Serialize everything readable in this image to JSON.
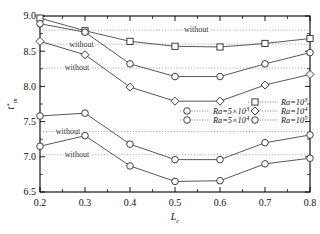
{
  "chart_data": {
    "type": "line",
    "title": "",
    "xlabel": "L_c",
    "ylabel": "t*_m",
    "xlim": [
      0.2,
      0.8
    ],
    "ylim": [
      6.5,
      9.0
    ],
    "grid": "horizontal-dotted-reference-lines",
    "legend_position": "inside-middle-right",
    "x": [
      0.2,
      0.3,
      0.4,
      0.5,
      0.6,
      0.7,
      0.8
    ],
    "xticklabels": [
      "0.2",
      "0.3",
      "0.4",
      "0.5",
      "0.6",
      "0.7",
      "0.8"
    ],
    "yticklabels": [
      "6.5",
      "7.0",
      "7.5",
      "8.0",
      "8.5",
      "9.0"
    ],
    "yticks": [
      6.5,
      7.0,
      7.5,
      8.0,
      8.5,
      9.0
    ],
    "series": [
      {
        "name": "Ra=10^3",
        "marker": "square",
        "values": [
          8.97,
          8.79,
          8.64,
          8.57,
          8.56,
          8.61,
          8.68
        ]
      },
      {
        "name": "Ra=5x10^3",
        "marker": "circle",
        "values": [
          8.89,
          8.77,
          8.32,
          8.14,
          8.14,
          8.32,
          8.48
        ]
      },
      {
        "name": "Ra=10^4",
        "marker": "diamond",
        "values": [
          8.64,
          8.45,
          7.99,
          7.79,
          7.79,
          8.02,
          8.17
        ]
      },
      {
        "name": "Ra=5x10^4",
        "marker": "circle",
        "values": [
          7.58,
          7.62,
          7.18,
          6.96,
          6.96,
          7.2,
          7.31
        ]
      },
      {
        "name": "Ra=10^5",
        "marker": "circle",
        "values": [
          7.15,
          7.3,
          6.87,
          6.65,
          6.66,
          6.9,
          6.98
        ]
      }
    ],
    "reference_lines": [
      {
        "label": "without",
        "value": 8.8,
        "label_x": 0.52
      },
      {
        "label": "without",
        "value": 8.6,
        "label_x": 0.265
      },
      {
        "label": "without",
        "value": 8.26,
        "label_x": 0.255
      },
      {
        "label": "without",
        "value": 7.36,
        "label_x": 0.235
      },
      {
        "label": "without",
        "value": 7.03,
        "label_x": 0.255
      }
    ]
  },
  "axes": {
    "y_label_base": "t",
    "y_label_star": "*",
    "y_label_sub": "m",
    "x_label_base": "L",
    "x_label_sub": "c"
  },
  "legend": {
    "entries": [
      {
        "prefix": "Ra=",
        "value": "10",
        "exp": "3",
        "marker": "square",
        "col": 2,
        "row": 1
      },
      {
        "prefix": "Ra=",
        "value": "5×10",
        "exp": "3",
        "marker": "circle",
        "col": 1,
        "row": 2
      },
      {
        "prefix": "Ra=",
        "value": "10",
        "exp": "4",
        "marker": "diamond",
        "col": 2,
        "row": 2
      },
      {
        "prefix": "Ra=",
        "value": "5×10",
        "exp": "4",
        "marker": "circle",
        "col": 1,
        "row": 3
      },
      {
        "prefix": "Ra=",
        "value": "10",
        "exp": "5",
        "marker": "circle",
        "col": 2,
        "row": 3
      }
    ]
  }
}
